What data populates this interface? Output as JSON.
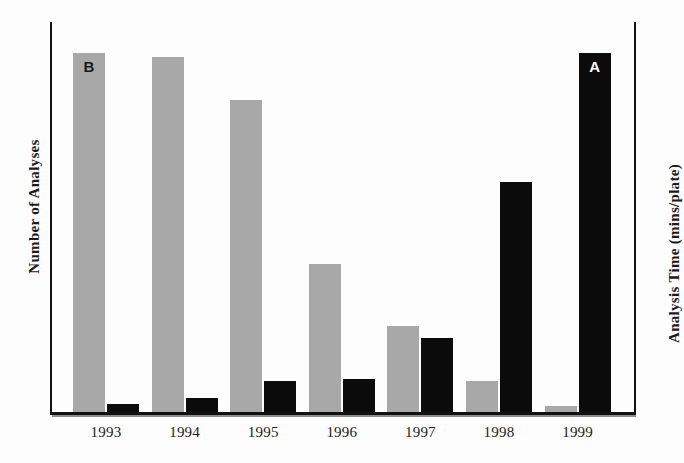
{
  "chart_data": {
    "type": "bar",
    "title": "",
    "xlabel": "",
    "ylabel": "Number of Analyses",
    "y2label": "Analysis Time (mins/plate)",
    "categories": [
      "1993",
      "1994",
      "1995",
      "1996",
      "1997",
      "1998",
      "1999"
    ],
    "grid": false,
    "legend_position": "in-bar-annotation",
    "series": [
      {
        "name": "B",
        "axis": "left",
        "label": "Number of Analyses",
        "color": "#a8a8a8",
        "annotation": "B",
        "annotation_on_category": "1993",
        "values": [
          92,
          91,
          80,
          38,
          22,
          8,
          1.5
        ],
        "ylim": [
          0,
          100
        ]
      },
      {
        "name": "A",
        "axis": "right",
        "label": "Analysis Time (mins/plate)",
        "color": "#0b0b0b",
        "annotation": "A",
        "annotation_on_category": "1999",
        "values": [
          2,
          3.5,
          8,
          8.5,
          19,
          59,
          92
        ],
        "ylim": [
          0,
          100
        ]
      }
    ]
  },
  "axes": {
    "left_title": "Number of Analyses",
    "right_title": "Analysis Time (mins/plate)"
  },
  "annotations": {
    "series_b_marker": "B",
    "series_a_marker": "A"
  },
  "colors": {
    "series_b": "#a8a8a8",
    "series_a": "#0b0b0b",
    "axis": "#111111",
    "background": "#fdfdfd"
  }
}
